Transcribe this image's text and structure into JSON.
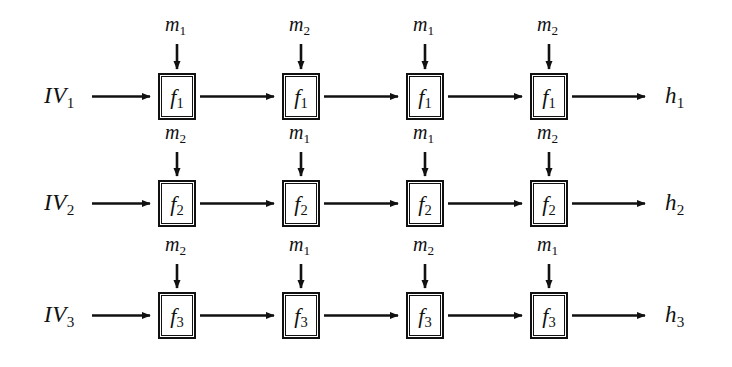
{
  "diagram": {
    "stroke_color": "#111111",
    "background": "#ffffff",
    "columns": 4,
    "rows": 3,
    "rows_data": [
      {
        "id": "row-1",
        "iv_label": "IV",
        "iv_sub": "1",
        "function_label": "f",
        "function_sub": "1",
        "output_label": "h",
        "output_sub": "1",
        "top_inputs": [
          {
            "label": "m",
            "sub": "1"
          },
          {
            "label": "m",
            "sub": "2"
          },
          {
            "label": "m",
            "sub": "1"
          },
          {
            "label": "m",
            "sub": "2"
          }
        ]
      },
      {
        "id": "row-2",
        "iv_label": "IV",
        "iv_sub": "2",
        "function_label": "f",
        "function_sub": "2",
        "output_label": "h",
        "output_sub": "2",
        "top_inputs": [
          {
            "label": "m",
            "sub": "2"
          },
          {
            "label": "m",
            "sub": "1"
          },
          {
            "label": "m",
            "sub": "1"
          },
          {
            "label": "m",
            "sub": "2"
          }
        ]
      },
      {
        "id": "row-3",
        "iv_label": "IV",
        "iv_sub": "3",
        "function_label": "f",
        "function_sub": "3",
        "output_label": "h",
        "output_sub": "3",
        "top_inputs": [
          {
            "label": "m",
            "sub": "2"
          },
          {
            "label": "m",
            "sub": "1"
          },
          {
            "label": "m",
            "sub": "2"
          },
          {
            "label": "m",
            "sub": "1"
          }
        ]
      }
    ]
  },
  "labels": {
    "iv1": "IV",
    "iv1sub": "1",
    "iv2": "IV",
    "iv2sub": "2",
    "iv3": "IV",
    "iv3sub": "3",
    "h1": "h",
    "h1sub": "1",
    "h2": "h",
    "h2sub": "2",
    "h3": "h",
    "h3sub": "3",
    "f1": "f",
    "f1sub": "1",
    "f2": "f",
    "f2sub": "2",
    "f3": "f",
    "f3sub": "3",
    "m": "m",
    "one": "1",
    "two": "2",
    "r1c1": "1",
    "r1c2": "2",
    "r1c3": "1",
    "r1c4": "2",
    "r2c1": "2",
    "r2c2": "1",
    "r2c3": "1",
    "r2c4": "2",
    "r3c1": "2",
    "r3c2": "1",
    "r3c3": "2",
    "r3c4": "1"
  }
}
